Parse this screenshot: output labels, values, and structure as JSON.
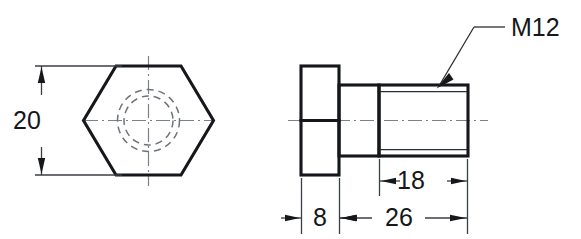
{
  "drawing": {
    "type": "engineering-drawing",
    "subject": "hex head bolt",
    "background_color": "#ffffff",
    "line_color": "#15171a",
    "views": [
      {
        "name": "end-view",
        "description": "hexagon head end view with hidden thread circles and centerlines"
      },
      {
        "name": "side-view",
        "description": "side elevation showing head, plain shank and threaded shank"
      }
    ],
    "dimensions": [
      {
        "id": "across-flats",
        "value": "20",
        "orientation": "vertical",
        "view": "end-view"
      },
      {
        "id": "head-thickness",
        "value": "8",
        "orientation": "horizontal",
        "view": "side-view"
      },
      {
        "id": "shank-length",
        "value": "26",
        "orientation": "horizontal",
        "view": "side-view"
      },
      {
        "id": "thread-length",
        "value": "18",
        "orientation": "horizontal",
        "view": "side-view"
      }
    ],
    "annotations": [
      {
        "id": "thread-callout",
        "text": "M12",
        "leader": "points to threaded shank",
        "view": "side-view"
      }
    ]
  },
  "labels": {
    "across_flats": "20",
    "head_thickness": "8",
    "shank_length": "26",
    "thread_length": "18",
    "thread_spec": "M12"
  }
}
